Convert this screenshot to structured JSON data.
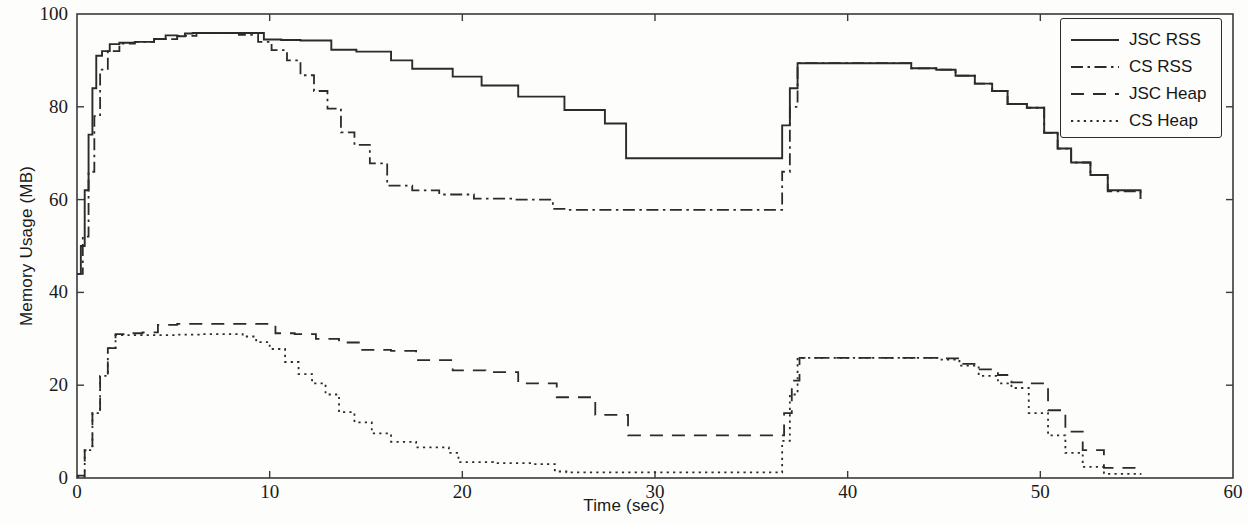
{
  "figure": {
    "background_color": "#fdfdfc",
    "line_color": "#2b2b2b",
    "axis_color": "#3a3a3a"
  },
  "legend": {
    "position": "top-right",
    "entries": [
      {
        "label": "JSC RSS",
        "style": "solid",
        "swatch_name": "legend-swatch-solid"
      },
      {
        "label": "CS RSS",
        "style": "dashdot",
        "swatch_name": "legend-swatch-dashdot"
      },
      {
        "label": "JSC Heap",
        "style": "dashed",
        "swatch_name": "legend-swatch-dashed"
      },
      {
        "label": "CS Heap",
        "style": "dotted",
        "swatch_name": "legend-swatch-dotted"
      }
    ]
  },
  "chart_data": {
    "type": "line",
    "title": "",
    "xlabel": "Time (sec)",
    "ylabel": "Memory Usage (MB)",
    "xlim": [
      0,
      60
    ],
    "ylim": [
      0,
      100
    ],
    "xticks": [
      0,
      10,
      20,
      30,
      40,
      50,
      60
    ],
    "yticks": [
      0,
      20,
      40,
      60,
      80,
      100
    ],
    "xtick_labels": [
      "0",
      "10",
      "20",
      "30",
      "40",
      "50",
      "60"
    ],
    "ytick_labels": [
      "0",
      "20",
      "40",
      "60",
      "80",
      "100"
    ],
    "grid": false,
    "legend_position": "upper right",
    "step_style": "post",
    "series": [
      {
        "name": "JSC RSS",
        "style": "solid",
        "x": [
          0.0,
          0.2,
          0.4,
          0.6,
          0.8,
          1.0,
          1.3,
          1.7,
          2.2,
          3.0,
          4.0,
          4.6,
          5.2,
          5.6,
          6.0,
          6.6,
          7.4,
          8.2,
          9.4,
          9.7,
          10.6,
          11.6,
          13.2,
          14.5,
          16.3,
          17.4,
          19.5,
          21.0,
          22.9,
          25.3,
          27.4,
          28.5,
          36.4,
          36.6,
          37.0,
          37.4,
          40.6,
          43.3,
          44.6,
          45.6,
          46.6,
          47.5,
          48.3,
          49.3,
          50.2,
          50.9,
          51.6,
          52.6,
          53.5,
          55.2
        ],
        "y": [
          44.0,
          50.0,
          62.0,
          74.0,
          84.0,
          91.0,
          92.0,
          93.5,
          93.8,
          94.0,
          94.6,
          95.4,
          95.2,
          95.8,
          95.9,
          95.9,
          95.9,
          95.9,
          95.9,
          94.5,
          94.4,
          94.3,
          92.3,
          91.9,
          90.0,
          88.2,
          86.5,
          84.6,
          82.2,
          79.3,
          76.4,
          68.9,
          68.9,
          76.0,
          84.0,
          89.4,
          89.4,
          88.3,
          88.0,
          86.7,
          85.0,
          83.4,
          80.6,
          79.8,
          74.4,
          71.0,
          68.0,
          65.3,
          62.0,
          60.2
        ]
      },
      {
        "name": "CS RSS",
        "style": "dashdot",
        "x": [
          0.0,
          0.3,
          0.6,
          0.9,
          1.2,
          1.6,
          2.2,
          3.0,
          4.0,
          5.2,
          6.2,
          7.4,
          8.4,
          9.4,
          10.1,
          10.9,
          11.6,
          12.3,
          13.0,
          13.7,
          14.4,
          15.2,
          16.1,
          17.4,
          18.8,
          20.6,
          22.6,
          24.7,
          25.4,
          36.3,
          36.6,
          37.0,
          37.4,
          40.6,
          43.3,
          44.6,
          45.6,
          46.6,
          47.5,
          48.3,
          49.3,
          50.2,
          50.9,
          51.6,
          52.6,
          53.5,
          55.2
        ],
        "y": [
          44.0,
          52.0,
          66.0,
          78.0,
          88.0,
          92.0,
          93.6,
          94.0,
          94.6,
          95.3,
          95.9,
          95.9,
          95.5,
          94.0,
          92.2,
          90.0,
          86.8,
          83.4,
          79.6,
          74.5,
          71.8,
          67.8,
          63.0,
          62.0,
          61.1,
          60.2,
          60.0,
          58.0,
          57.8,
          57.8,
          66.0,
          80.0,
          89.4,
          89.4,
          88.3,
          88.0,
          86.7,
          85.0,
          83.4,
          80.6,
          79.8,
          74.4,
          71.0,
          68.0,
          65.3,
          61.8,
          60.2
        ]
      },
      {
        "name": "JSC Heap",
        "style": "dashed",
        "x": [
          0.0,
          0.4,
          0.8,
          1.2,
          1.6,
          2.0,
          2.6,
          3.4,
          4.2,
          5.2,
          6.4,
          7.6,
          8.6,
          9.4,
          10.3,
          11.3,
          12.4,
          13.6,
          14.7,
          16.3,
          17.6,
          19.5,
          21.2,
          22.9,
          24.9,
          26.9,
          28.6,
          36.4,
          36.7,
          37.1,
          37.5,
          40.8,
          43.4,
          44.8,
          45.8,
          46.8,
          47.8,
          48.5,
          49.4,
          50.4,
          51.3,
          52.2,
          53.3,
          55.2
        ],
        "y": [
          0.5,
          6.0,
          14.0,
          22.0,
          28.0,
          31.0,
          31.2,
          31.4,
          33.0,
          33.2,
          33.2,
          33.2,
          33.2,
          33.2,
          31.2,
          31.0,
          30.0,
          29.2,
          27.6,
          27.4,
          25.4,
          23.2,
          22.8,
          20.4,
          17.4,
          13.6,
          9.2,
          9.2,
          14.0,
          21.0,
          25.9,
          25.9,
          25.9,
          25.8,
          24.6,
          23.4,
          22.2,
          20.6,
          20.4,
          14.6,
          10.0,
          6.0,
          2.2,
          1.4
        ]
      },
      {
        "name": "CS Heap",
        "style": "dotted",
        "x": [
          0.0,
          0.4,
          0.8,
          1.2,
          1.6,
          2.0,
          2.8,
          4.0,
          5.2,
          6.4,
          7.6,
          8.6,
          9.3,
          10.0,
          10.8,
          11.5,
          12.2,
          12.9,
          13.6,
          14.4,
          15.3,
          16.3,
          17.6,
          19.3,
          19.8,
          21.6,
          23.6,
          24.8,
          25.4,
          36.3,
          36.6,
          37.0,
          37.4,
          40.8,
          43.4,
          44.8,
          45.8,
          46.8,
          47.8,
          48.5,
          49.4,
          50.4,
          51.3,
          52.2,
          53.3,
          55.2
        ],
        "y": [
          0.3,
          6.0,
          14.0,
          22.0,
          28.0,
          30.8,
          30.8,
          30.8,
          30.9,
          31.0,
          31.0,
          30.5,
          29.3,
          27.8,
          25.0,
          22.4,
          20.4,
          18.0,
          14.2,
          12.0,
          9.6,
          7.8,
          6.6,
          5.4,
          3.4,
          3.2,
          3.0,
          1.4,
          1.2,
          1.2,
          8.0,
          18.0,
          25.9,
          25.9,
          25.9,
          25.5,
          24.2,
          22.0,
          20.4,
          19.4,
          14.0,
          9.2,
          5.4,
          2.4,
          0.9,
          0.7
        ]
      }
    ]
  }
}
